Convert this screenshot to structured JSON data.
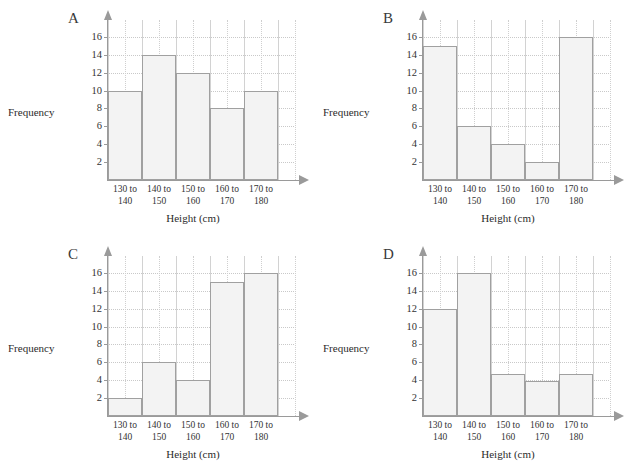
{
  "page": {
    "background": "#ffffff",
    "bar_fill": "#f3f3f3",
    "bar_stroke": "#a0a0a0",
    "axis_color": "#9a9a9a",
    "grid_color": "#cfcfcf"
  },
  "common": {
    "y_axis_title": "Frequency",
    "x_axis_title": "Height (cm)",
    "y_ticks": [
      "2",
      "4",
      "6",
      "8",
      "10",
      "12",
      "14",
      "16"
    ],
    "categories": [
      {
        "line1": "130 to",
        "line2": "140"
      },
      {
        "line1": "140 to",
        "line2": "150"
      },
      {
        "line1": "150 to",
        "line2": "160"
      },
      {
        "line1": "160 to",
        "line2": "170"
      },
      {
        "line1": "170 to",
        "line2": "180"
      }
    ]
  },
  "panels": [
    {
      "letter": "A"
    },
    {
      "letter": "B"
    },
    {
      "letter": "C"
    },
    {
      "letter": "D"
    }
  ],
  "chart_data": [
    {
      "type": "bar",
      "title": "A",
      "xlabel": "Height (cm)",
      "ylabel": "Frequency",
      "categories": [
        "130 to 140",
        "140 to 150",
        "150 to 160",
        "160 to 170",
        "170 to 180"
      ],
      "values": [
        10,
        14,
        12,
        8,
        10
      ],
      "ylim": [
        0,
        17
      ],
      "yticks": [
        2,
        4,
        6,
        8,
        10,
        12,
        14,
        16
      ],
      "grid": true,
      "legend": "none"
    },
    {
      "type": "bar",
      "title": "B",
      "xlabel": "Height (cm)",
      "ylabel": "Frequency",
      "categories": [
        "130 to 140",
        "140 to 150",
        "150 to 160",
        "160 to 170",
        "170 to 180"
      ],
      "values": [
        15,
        6,
        4,
        2,
        16
      ],
      "ylim": [
        0,
        17
      ],
      "yticks": [
        2,
        4,
        6,
        8,
        10,
        12,
        14,
        16
      ],
      "grid": true,
      "legend": "none"
    },
    {
      "type": "bar",
      "title": "C",
      "xlabel": "Height (cm)",
      "ylabel": "Frequency",
      "categories": [
        "130 to 140",
        "140 to 150",
        "150 to 160",
        "160 to 170",
        "170 to 180"
      ],
      "values": [
        2,
        6,
        4,
        15,
        16
      ],
      "ylim": [
        0,
        17
      ],
      "yticks": [
        2,
        4,
        6,
        8,
        10,
        12,
        14,
        16
      ],
      "grid": true,
      "legend": "none"
    },
    {
      "type": "bar",
      "title": "D",
      "xlabel": "Height (cm)",
      "ylabel": "Frequency",
      "categories": [
        "130 to 140",
        "140 to 150",
        "150 to 160",
        "160 to 170",
        "170 to 180"
      ],
      "values": [
        12,
        16,
        4.7,
        3.9,
        4.7
      ],
      "ylim": [
        0,
        17
      ],
      "yticks": [
        2,
        4,
        6,
        8,
        10,
        12,
        14,
        16
      ],
      "grid": true,
      "legend": "none"
    }
  ]
}
